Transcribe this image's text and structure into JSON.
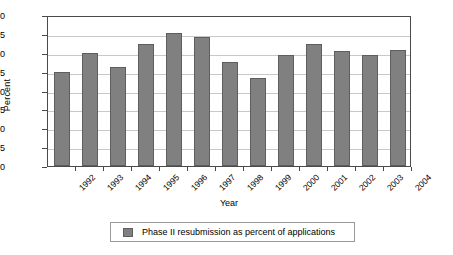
{
  "chart_data": {
    "type": "bar",
    "title": "",
    "xlabel": "Year",
    "ylabel": "Percent",
    "categories": [
      "1992",
      "1993",
      "1994",
      "1995",
      "1996",
      "1997",
      "1998",
      "1999",
      "2000",
      "2001",
      "2002",
      "2003",
      "2004"
    ],
    "values": [
      25.0,
      30.0,
      26.1,
      32.2,
      35.2,
      34.2,
      27.6,
      23.3,
      29.4,
      32.3,
      30.5,
      29.3,
      30.7
    ],
    "series": [
      {
        "name": "Phase II resubmission as percent of applications",
        "values": [
          25.0,
          30.0,
          26.1,
          32.2,
          35.2,
          34.2,
          27.6,
          23.3,
          29.4,
          32.3,
          30.5,
          29.3,
          30.7
        ]
      }
    ],
    "ylim": [
      0,
      40
    ],
    "ytick_values": [
      0,
      5,
      10,
      15,
      20,
      25,
      30,
      35,
      40
    ],
    "ytick_labels": [
      "0",
      "5",
      "10",
      "15",
      "20",
      "25",
      "30",
      "35",
      "40"
    ],
    "grid": true,
    "grid_axis": "y",
    "legend_position": "bottom",
    "legend_entries": [
      "Phase II resubmission as percent of applications"
    ],
    "bar_color": "#808080",
    "bar_edge_color": "#5e5e5e",
    "gridline_color": "#c8c8c8",
    "axis_color": "#4a4a4a"
  },
  "legend": {
    "label": "Phase II resubmission as percent of applications"
  }
}
